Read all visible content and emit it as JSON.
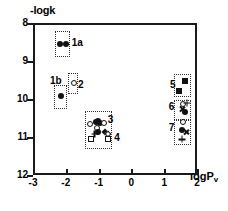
{
  "chart_data": {
    "type": "scatter",
    "title": "",
    "xlabel": "logPv",
    "ylabel": "-logk",
    "xlim": [
      -3,
      2
    ],
    "ylim": [
      12,
      8
    ],
    "y_inverted": true,
    "grid": false,
    "legend": "none",
    "xticks": [
      "-3",
      "-2",
      "-1",
      "0",
      "1",
      "2"
    ],
    "xtick_values": [
      -3,
      -2,
      -1,
      0,
      1,
      2
    ],
    "yticks": [
      "8",
      "9",
      "10",
      "11",
      "12"
    ],
    "ytick_values": [
      8,
      9,
      10,
      11,
      12
    ],
    "groups": [
      {
        "label": "1a",
        "label_x": -1.82,
        "label_y": 8.52,
        "box": {
          "x0": -2.32,
          "x1": -1.86,
          "y0": 8.22,
          "y1": 8.9
        },
        "points": [
          {
            "x": -2.18,
            "y": 8.56,
            "marker": "filled-circle"
          },
          {
            "x": -2.0,
            "y": 8.56,
            "marker": "filled-circle"
          }
        ]
      },
      {
        "label": "1b",
        "label_x": -2.48,
        "label_y": 9.52,
        "box": {
          "x0": -2.35,
          "x1": -1.97,
          "y0": 9.64,
          "y1": 10.26
        },
        "points": [
          {
            "x": -2.16,
            "y": 9.92,
            "marker": "filled-circle"
          }
        ]
      },
      {
        "label": "2",
        "label_x": -1.63,
        "label_y": 9.62,
        "box": {
          "x0": -1.92,
          "x1": -1.62,
          "y0": 9.31,
          "y1": 9.86
        },
        "points": [
          {
            "x": -1.76,
            "y": 9.57,
            "marker": "open-circle"
          }
        ]
      },
      {
        "label": "3",
        "label_x": -0.72,
        "label_y": 10.55,
        "box": {
          "x0": -1.42,
          "x1": -0.58,
          "y0": 10.32,
          "y1": 11.32
        },
        "points": [
          {
            "x": -1.27,
            "y": 10.66,
            "marker": "open-circle"
          },
          {
            "x": -1.09,
            "y": 10.6,
            "marker": "filled-circle"
          },
          {
            "x": -1.03,
            "y": 10.57,
            "marker": "filled-circle"
          },
          {
            "x": -0.96,
            "y": 10.63,
            "marker": "filled-circle"
          },
          {
            "x": -0.83,
            "y": 10.62,
            "marker": "open-circle"
          },
          {
            "x": -1.05,
            "y": 10.77,
            "marker": "open-circle"
          },
          {
            "x": -1.02,
            "y": 10.88,
            "marker": "filled-circle"
          }
        ]
      },
      {
        "label": "4",
        "label_x": -0.52,
        "label_y": 11.02,
        "box": {
          "x0": -1.42,
          "x1": -0.58,
          "y0": 10.32,
          "y1": 11.32
        },
        "points": [
          {
            "x": -1.12,
            "y": 10.92,
            "marker": "plus"
          },
          {
            "x": -0.8,
            "y": 10.86,
            "marker": "filled-diamond"
          },
          {
            "x": -0.72,
            "y": 10.92,
            "marker": "open-diamond"
          },
          {
            "x": -1.22,
            "y": 11.06,
            "marker": "open-square"
          },
          {
            "x": -0.7,
            "y": 11.06,
            "marker": "open-square"
          }
        ]
      },
      {
        "label": "5",
        "label_x": 1.18,
        "label_y": 9.64,
        "box": {
          "x0": 1.31,
          "x1": 1.82,
          "y0": 9.34,
          "y1": 9.95
        },
        "points": [
          {
            "x": 1.62,
            "y": 9.52,
            "marker": "filled-square"
          },
          {
            "x": 1.44,
            "y": 9.78,
            "marker": "filled-square"
          }
        ]
      },
      {
        "label": "6",
        "label_x": 1.14,
        "label_y": 10.2,
        "box": {
          "x0": 1.31,
          "x1": 1.82,
          "y0": 10.02,
          "y1": 10.56
        },
        "points": [
          {
            "x": 1.56,
            "y": 10.12,
            "marker": "open-circle"
          },
          {
            "x": 1.7,
            "y": 10.1,
            "marker": "plus"
          },
          {
            "x": 1.55,
            "y": 10.26,
            "marker": "cross"
          },
          {
            "x": 1.63,
            "y": 10.33,
            "marker": "filled-circle"
          }
        ]
      },
      {
        "label": "7",
        "label_x": 1.14,
        "label_y": 10.76,
        "box": {
          "x0": 1.31,
          "x1": 1.82,
          "y0": 10.56,
          "y1": 11.22
        },
        "points": [
          {
            "x": 1.56,
            "y": 10.6,
            "marker": "open-circle"
          },
          {
            "x": 1.55,
            "y": 10.82,
            "marker": "filled-circle"
          },
          {
            "x": 1.66,
            "y": 10.86,
            "marker": "cross"
          },
          {
            "x": 1.54,
            "y": 11.06,
            "marker": "plus"
          }
        ]
      }
    ]
  }
}
